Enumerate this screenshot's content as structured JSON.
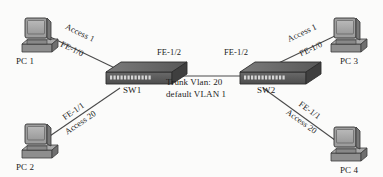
{
  "diagram": {
    "background_color": "#fbfbfa",
    "line_color": "#4a4a4a",
    "device_color": "#6e6e6e"
  },
  "nodes": [
    {
      "id": "pc1",
      "label": "PC 1",
      "type": "pc-icon"
    },
    {
      "id": "pc2",
      "label": "PC 2",
      "type": "pc-icon"
    },
    {
      "id": "pc3",
      "label": "PC 3",
      "type": "pc-icon"
    },
    {
      "id": "pc4",
      "label": "PC 4",
      "type": "pc-icon"
    },
    {
      "id": "sw1",
      "label": "SW1",
      "type": "switch-icon"
    },
    {
      "id": "sw2",
      "label": "SW2",
      "type": "switch-icon"
    }
  ],
  "links": [
    {
      "id": "pc1-sw1",
      "from": "PC 1",
      "to": "SW1",
      "upper_label": "Access 1",
      "lower_label": "FE-1/0"
    },
    {
      "id": "pc2-sw1",
      "from": "PC 2",
      "to": "SW1",
      "upper_label": "FE-1/1",
      "lower_label": "Access 20"
    },
    {
      "id": "pc3-sw2",
      "from": "PC 3",
      "to": "SW2",
      "upper_label": "Access 1",
      "lower_label": "FE-1/0"
    },
    {
      "id": "pc4-sw2",
      "from": "PC 4",
      "to": "SW2",
      "upper_label": "FE-1/1",
      "lower_label": "Access 20"
    },
    {
      "id": "sw1-sw2",
      "from": "SW1",
      "to": "SW2",
      "upper_label": "",
      "lower_label": ""
    }
  ],
  "port_labels": {
    "sw1_trunk_port": "FE-1/2",
    "sw2_trunk_port": "FE-1/2"
  },
  "trunk_annotation": {
    "line1": "Trunk Vlan: 20",
    "line2": "default VLAN 1"
  }
}
